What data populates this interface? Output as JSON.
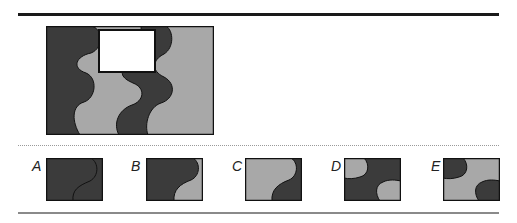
{
  "puzzle": {
    "type": "missing-piece pattern completion",
    "colors": {
      "dark": "#3b3b3b",
      "light": "#a8a8a8",
      "outline": "#111111",
      "blank": "#ffffff"
    },
    "main_figure": {
      "description": "Rectangle with wavy vertical stripes alternating dark and light grey; a white rectangular region at top-center is missing"
    },
    "options": [
      {
        "label": "A",
        "description": "All dark with a thin S-curve line"
      },
      {
        "label": "B",
        "description": "Dark with light region at bottom-right via S-curve"
      },
      {
        "label": "C",
        "description": "Light with dark region at bottom-right via S-curve"
      },
      {
        "label": "D",
        "description": "Dark with light quarter-circles at top-left and bottom-right"
      },
      {
        "label": "E",
        "description": "Light with dark quarter-circles at top-left and bottom-right"
      }
    ]
  }
}
